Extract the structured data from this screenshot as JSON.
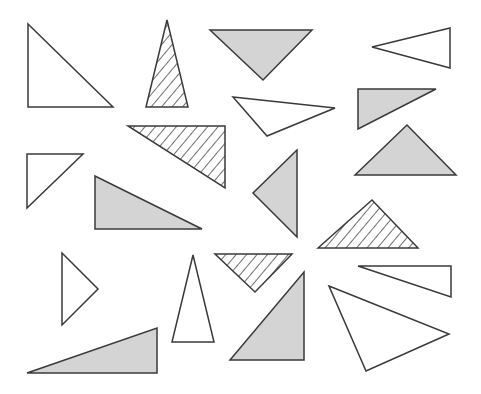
{
  "figure": {
    "width": 481,
    "height": 394,
    "colors": {
      "stroke": "#3a3a3a",
      "gray_fill": "#d4d4d4",
      "white_fill": "#ffffff",
      "hatch": "#222222"
    },
    "triangles": [
      {
        "id": 1,
        "fill": "white",
        "points": "28,24 28,107 113,107"
      },
      {
        "id": 2,
        "fill": "hatched",
        "points": "167,20 146,107 188,107"
      },
      {
        "id": 3,
        "fill": "gray",
        "points": "210,30 312,30 263,80"
      },
      {
        "id": 4,
        "fill": "white",
        "points": "372,47 450,28 450,68"
      },
      {
        "id": 5,
        "fill": "white",
        "points": "233,97 335,108 267,136"
      },
      {
        "id": 6,
        "fill": "gray",
        "points": "358,89 436,89 358,129"
      },
      {
        "id": 7,
        "fill": "hatched",
        "points": "128,126 225,126 225,188"
      },
      {
        "id": 8,
        "fill": "white",
        "points": "27,154 83,154 27,208"
      },
      {
        "id": 9,
        "fill": "gray",
        "points": "297,150 253,193 297,237"
      },
      {
        "id": 10,
        "fill": "gray",
        "points": "355,175 407,125 456,175"
      },
      {
        "id": 11,
        "fill": "gray",
        "points": "95,176 95,229 202,229"
      },
      {
        "id": 12,
        "fill": "hatched",
        "points": "318,248 372,200 418,248"
      },
      {
        "id": 13,
        "fill": "white",
        "points": "62,253 98,289 62,325"
      },
      {
        "id": 14,
        "fill": "white",
        "points": "193,255 172,342 214,342"
      },
      {
        "id": 15,
        "fill": "hatched",
        "points": "215,254 292,254 255,292"
      },
      {
        "id": 16,
        "fill": "gray",
        "points": "304,272 304,360 230,360"
      },
      {
        "id": 17,
        "fill": "white",
        "points": "358,266 451,266 451,297"
      },
      {
        "id": 18,
        "fill": "white",
        "points": "329,286 449,334 366,371"
      },
      {
        "id": 19,
        "fill": "gray",
        "points": "27,373 157,328 157,373"
      }
    ],
    "counts": {
      "white": 8,
      "gray": 7,
      "hatched": 4,
      "total": 19
    }
  }
}
